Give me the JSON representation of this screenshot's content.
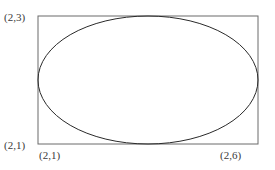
{
  "diagram": {
    "type": "ellipse inscribed in rectangle",
    "labels": {
      "top_left": "(2,3)",
      "bottom_left": "(2,1)",
      "bottom_left_x": "(2,1)",
      "bottom_right": "(2,6)"
    },
    "rectangle": {
      "x": 38,
      "y": 16,
      "width": 220,
      "height": 128,
      "stroke": "#6a6a6a"
    },
    "ellipse": {
      "cx": 148,
      "cy": 80,
      "rx": 110,
      "ry": 64,
      "stroke": "#2a2a2a"
    }
  }
}
